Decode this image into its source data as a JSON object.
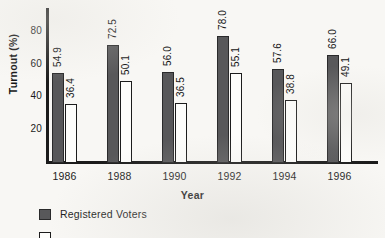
{
  "chart_data": {
    "type": "bar",
    "title": "",
    "xlabel": "Year",
    "ylabel": "Turnout (%)",
    "categories": [
      "1986",
      "1988",
      "1990",
      "1992",
      "1994",
      "1996"
    ],
    "series": [
      {
        "name": "Registered Voters",
        "color": "#58585a",
        "fill": "solid-dark-gray",
        "values": [
          54.9,
          72.5,
          56.0,
          78.0,
          57.6,
          66.0
        ],
        "value_labels": [
          "54.9",
          "72.5",
          "56.0",
          "78.0",
          "57.6",
          "66.0"
        ]
      },
      {
        "name": "",
        "color": "#fdfdfb",
        "fill": "white-outlined",
        "values": [
          36.4,
          50.1,
          36.5,
          55.1,
          38.8,
          49.1
        ],
        "value_labels": [
          "36.4",
          "50.1",
          "36.5",
          "55.1",
          "38.8",
          "49.1"
        ]
      }
    ],
    "yticks": [
      20,
      40,
      60,
      80
    ],
    "ytick_labels": [
      "20",
      "40",
      "60",
      "80"
    ],
    "ylim": [
      0,
      90
    ],
    "grid": false,
    "legend_position": "bottom-left",
    "data_labels_rotated": true
  },
  "legend": {
    "items": [
      {
        "label": "Registered Voters",
        "swatch": "primary"
      },
      {
        "label": "",
        "swatch": "secondary"
      }
    ]
  }
}
